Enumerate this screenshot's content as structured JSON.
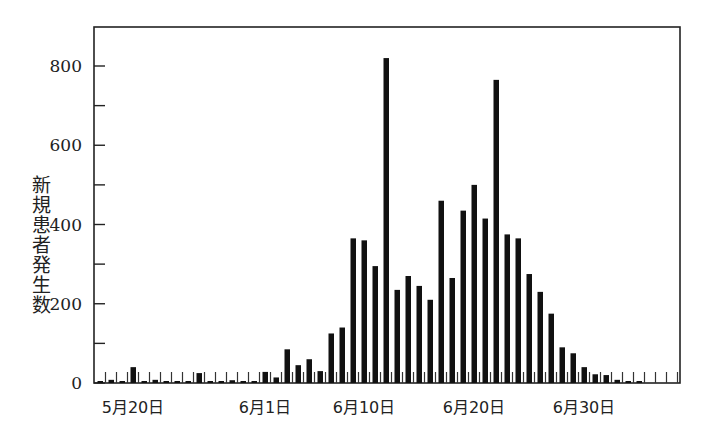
{
  "chart_data": {
    "type": "bar",
    "title": "",
    "xlabel": "",
    "ylabel": "新規患者発生数",
    "ylim": [
      0,
      900
    ],
    "yticks_major": [
      0,
      200,
      400,
      600,
      800
    ],
    "yticks_minor": [
      100,
      300,
      500,
      700
    ],
    "grid": false,
    "legend": null,
    "x_tick_labels": [
      {
        "label": "5月20日",
        "day_index": 3
      },
      {
        "label": "6月1日",
        "day_index": 15
      },
      {
        "label": "6月10日",
        "day_index": 24
      },
      {
        "label": "6月20日",
        "day_index": 34
      },
      {
        "label": "6月30日",
        "day_index": 44
      }
    ],
    "categories": [
      "5/17",
      "5/18",
      "5/19",
      "5/20",
      "5/21",
      "5/22",
      "5/23",
      "5/24",
      "5/25",
      "5/26",
      "5/27",
      "5/28",
      "5/29",
      "5/30",
      "5/31",
      "6/1",
      "6/2",
      "6/3",
      "6/4",
      "6/5",
      "6/6",
      "6/7",
      "6/8",
      "6/9",
      "6/10",
      "6/11",
      "6/12",
      "6/13",
      "6/14",
      "6/15",
      "6/16",
      "6/17",
      "6/18",
      "6/19",
      "6/20",
      "6/21",
      "6/22",
      "6/23",
      "6/24",
      "6/25",
      "6/26",
      "6/27",
      "6/28",
      "6/29",
      "6/30",
      "7/1",
      "7/2",
      "7/3",
      "7/4",
      "7/5",
      "7/6",
      "7/7",
      "7/8"
    ],
    "values": [
      5,
      8,
      3,
      40,
      5,
      8,
      4,
      5,
      3,
      25,
      3,
      4,
      7,
      3,
      3,
      28,
      14,
      85,
      45,
      60,
      30,
      125,
      140,
      365,
      360,
      295,
      820,
      235,
      270,
      245,
      210,
      460,
      265,
      435,
      500,
      415,
      765,
      375,
      365,
      275,
      230,
      175,
      90,
      75,
      40,
      22,
      20,
      8,
      5,
      3,
      0,
      0,
      0
    ]
  },
  "axes": {
    "y_tick_labels": [
      "0",
      "200",
      "400",
      "600",
      "800"
    ]
  }
}
